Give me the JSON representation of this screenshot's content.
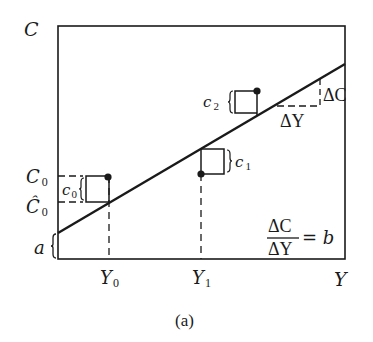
{
  "figure": {
    "caption": "(a)",
    "axis": {
      "y_label": "C",
      "x_label": "Y"
    },
    "intercept_label": "a",
    "y_marks": {
      "C0": {
        "main": "C",
        "sub": "0"
      },
      "C0_hat": {
        "main": "Ĉ",
        "sub": "0"
      }
    },
    "x_marks": {
      "Y0": {
        "main": "Y",
        "sub": "0"
      },
      "Y1": {
        "main": "Y",
        "sub": "1"
      }
    },
    "residuals": [
      {
        "main": "c",
        "sub": "0"
      },
      {
        "main": "c",
        "sub": "1"
      },
      {
        "main": "c",
        "sub": "2"
      }
    ],
    "slope_triangle": {
      "delta_c": "ΔC",
      "delta_y": "ΔY"
    },
    "equation": {
      "numerator": "ΔC",
      "denominator": "ΔY",
      "rhs": "= b"
    },
    "colors": {
      "ink": "#1a1a1a",
      "background": "#ffffff"
    }
  }
}
